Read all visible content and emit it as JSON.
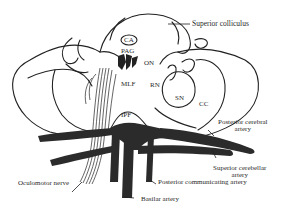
{
  "diagram": {
    "colors": {
      "outline": "#222222",
      "artery_fill": "#2b2b2b",
      "background": "#ffffff",
      "text": "#2a2a2a"
    },
    "structure_labels": {
      "superior_colliculus": "Superior colliculus",
      "ca": "CA",
      "pag": "PAG",
      "on": "ON",
      "mlf": "MLF",
      "rn": "RN",
      "sn": "SN",
      "cc": "CC",
      "ipf": "IPF"
    },
    "vessel_labels": {
      "posterior_cerebral_line1": "Posterior cerebral",
      "posterior_cerebral_line2": "artery",
      "superior_cerebellar_line1": "Superior cerebellar",
      "superior_cerebellar_line2": "artery",
      "posterior_communicating": "Posterior communicating artery",
      "basilar": "Basilar artery"
    },
    "nerve_labels": {
      "oculomotor": "Oculomotor nerve"
    }
  }
}
